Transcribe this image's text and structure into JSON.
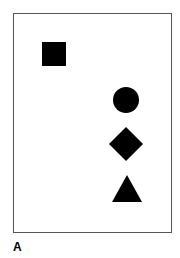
{
  "figure": {
    "panel_label": "A",
    "frame": {
      "border_color": "#555555",
      "background": "#ffffff"
    },
    "shapes": [
      {
        "type": "square",
        "color": "#000000"
      },
      {
        "type": "circle",
        "color": "#000000"
      },
      {
        "type": "diamond",
        "color": "#000000"
      },
      {
        "type": "triangle",
        "color": "#000000"
      }
    ]
  }
}
